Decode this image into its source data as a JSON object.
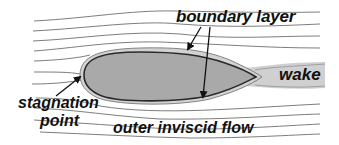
{
  "diagram": {
    "type": "airfoil-flow-schematic",
    "labels": {
      "boundary_layer": "boundary layer",
      "wake": "wake",
      "stagnation": "stagnation",
      "point": "point",
      "outer_flow": "outer inviscid flow"
    },
    "colors": {
      "airfoil_fill": "#a9a9a9",
      "airfoil_outline": "#2a2a2a",
      "boundary_layer_band": "#cfcfcf",
      "wake_band": "#c8c8c8",
      "streamline": "#6e6e6e",
      "text": "#111111",
      "background": "#ffffff"
    },
    "elements": [
      {
        "id": "airfoil",
        "kind": "shape"
      },
      {
        "id": "boundary-layer",
        "kind": "band"
      },
      {
        "id": "wake",
        "kind": "band"
      },
      {
        "id": "streamlines",
        "kind": "lines",
        "count": 11
      },
      {
        "id": "arrow-bl-upper",
        "from": "boundary layer",
        "to": "upper surface"
      },
      {
        "id": "arrow-bl-lower",
        "from": "boundary layer",
        "to": "lower surface"
      },
      {
        "id": "arrow-stagnation",
        "from": "stagnation point",
        "to": "leading edge"
      }
    ]
  }
}
